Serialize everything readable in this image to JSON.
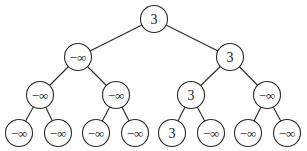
{
  "diagram": {
    "type": "game-tree",
    "colors": {
      "stroke": "#2a2a2a",
      "fill": "#ffffff",
      "text": "#1a1a1a"
    },
    "node_radius": 13.5,
    "nodes": [
      {
        "id": "n0",
        "label": "3",
        "x": 154,
        "y": 19,
        "level": 0
      },
      {
        "id": "n1",
        "label": "−∞",
        "x": 78,
        "y": 57,
        "level": 1
      },
      {
        "id": "n2",
        "label": "3",
        "x": 230,
        "y": 57,
        "level": 1
      },
      {
        "id": "n3",
        "label": "−∞",
        "x": 40,
        "y": 95,
        "level": 2
      },
      {
        "id": "n4",
        "label": "−∞",
        "x": 116,
        "y": 95,
        "level": 2
      },
      {
        "id": "n5",
        "label": "3",
        "x": 191,
        "y": 95,
        "level": 2
      },
      {
        "id": "n6",
        "label": "−∞",
        "x": 267,
        "y": 95,
        "level": 2
      },
      {
        "id": "n7",
        "label": "−∞",
        "x": 19,
        "y": 133,
        "level": 3
      },
      {
        "id": "n8",
        "label": "−∞",
        "x": 58,
        "y": 133,
        "level": 3
      },
      {
        "id": "n9",
        "label": "−∞",
        "x": 96,
        "y": 133,
        "level": 3
      },
      {
        "id": "n10",
        "label": "−∞",
        "x": 135,
        "y": 133,
        "level": 3
      },
      {
        "id": "n11",
        "label": "3",
        "x": 172,
        "y": 133,
        "level": 3
      },
      {
        "id": "n12",
        "label": "−∞",
        "x": 211,
        "y": 133,
        "level": 3
      },
      {
        "id": "n13",
        "label": "−∞",
        "x": 248,
        "y": 133,
        "level": 3
      },
      {
        "id": "n14",
        "label": "−∞",
        "x": 287,
        "y": 133,
        "level": 3
      }
    ],
    "edges": [
      [
        "n0",
        "n1"
      ],
      [
        "n0",
        "n2"
      ],
      [
        "n1",
        "n3"
      ],
      [
        "n1",
        "n4"
      ],
      [
        "n2",
        "n5"
      ],
      [
        "n2",
        "n6"
      ],
      [
        "n3",
        "n7"
      ],
      [
        "n3",
        "n8"
      ],
      [
        "n4",
        "n9"
      ],
      [
        "n4",
        "n10"
      ],
      [
        "n5",
        "n11"
      ],
      [
        "n5",
        "n12"
      ],
      [
        "n6",
        "n13"
      ],
      [
        "n6",
        "n14"
      ]
    ]
  }
}
